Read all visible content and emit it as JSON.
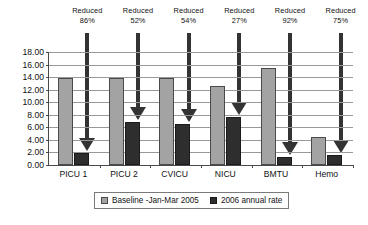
{
  "chart_data": {
    "type": "bar",
    "title": "",
    "xlabel": "",
    "ylabel": "",
    "ylim": [
      0,
      18
    ],
    "ytick_step": 2,
    "grid": true,
    "legend_position": "bottom",
    "categories": [
      "PICU 1",
      "PICU 2",
      "CVICU",
      "NICU",
      "BMTU",
      "Hemo"
    ],
    "ytick_labels": [
      "18.00",
      "16.00",
      "14.00",
      "12.00",
      "10.00",
      "8.00",
      "6.00",
      "4.00",
      "2.00",
      "0.00"
    ],
    "series": [
      {
        "name": "Baseline -Jan-Mar 2005",
        "color": "#a3a3a3",
        "values": [
          13.8,
          13.9,
          13.9,
          12.6,
          15.4,
          4.5
        ]
      },
      {
        "name": "2006 annual rate",
        "color": "#2e2e2e",
        "values": [
          1.9,
          6.8,
          6.6,
          7.6,
          1.2,
          1.6
        ]
      }
    ],
    "annotations": [
      {
        "label": "Reduced",
        "value": "86%"
      },
      {
        "label": "Reduced",
        "value": "52%"
      },
      {
        "label": "Reduced",
        "value": "54%"
      },
      {
        "label": "Reduced",
        "value": "27%"
      },
      {
        "label": "Reduced",
        "value": "92%"
      },
      {
        "label": "Reduced",
        "value": "75%"
      }
    ]
  }
}
